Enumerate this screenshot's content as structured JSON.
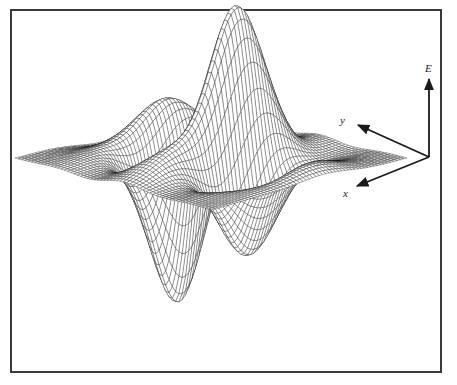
{
  "figure": {
    "type": "3d-wireframe-surface",
    "axes": {
      "vertical": {
        "label": "E"
      },
      "depth": {
        "label": "y"
      },
      "horizontal": {
        "label": "x"
      }
    },
    "colors": {
      "mesh": "#1a1a1a",
      "face": "#ffffff",
      "frame": "#3a3a3a",
      "arrow": "#1a1a1a"
    },
    "mesh": {
      "grid_u": 60,
      "grid_v": 60
    }
  }
}
